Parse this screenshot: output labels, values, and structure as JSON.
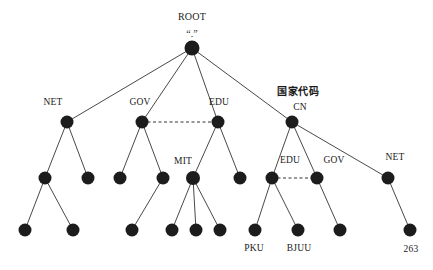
{
  "diagram": {
    "type": "tree",
    "background": "#ffffff",
    "node_color": "#1c1c1c",
    "edge_color": "#333333",
    "nodes": [
      {
        "id": "root",
        "label": "ROOT",
        "sublabel": "“.”",
        "x": 192,
        "y": 48,
        "r": 7.5
      },
      {
        "id": "net",
        "label": "NET",
        "x": 67,
        "y": 122,
        "r": 6.5
      },
      {
        "id": "gov",
        "label": "GOV",
        "x": 142,
        "y": 122,
        "r": 6.5
      },
      {
        "id": "edu",
        "label": "EDU",
        "x": 218,
        "y": 122,
        "r": 6.5
      },
      {
        "id": "cn",
        "label": "CN",
        "toplabel": "国家代码",
        "x": 292,
        "y": 122,
        "r": 6.5
      },
      {
        "id": "net-a",
        "label": "",
        "x": 45,
        "y": 178,
        "r": 6.5
      },
      {
        "id": "net-b",
        "label": "",
        "x": 88,
        "y": 178,
        "r": 6.5
      },
      {
        "id": "gov-a",
        "label": "",
        "x": 120,
        "y": 178,
        "r": 6.5
      },
      {
        "id": "gov-b",
        "label": "",
        "x": 163,
        "y": 178,
        "r": 6.5
      },
      {
        "id": "mit",
        "label": "MIT",
        "x": 193,
        "y": 178,
        "r": 7.0
      },
      {
        "id": "edu-b",
        "label": "",
        "x": 240,
        "y": 178,
        "r": 6.5
      },
      {
        "id": "cn-edu",
        "label": "EDU",
        "x": 272,
        "y": 178,
        "r": 6.5
      },
      {
        "id": "cn-gov",
        "label": "GOV",
        "x": 317,
        "y": 178,
        "r": 6.5
      },
      {
        "id": "cn-net",
        "label": "NET",
        "x": 388,
        "y": 178,
        "r": 6.5
      },
      {
        "id": "leaf-1",
        "label": "",
        "x": 25,
        "y": 230,
        "r": 6.5
      },
      {
        "id": "leaf-2",
        "label": "",
        "x": 73,
        "y": 230,
        "r": 6.5
      },
      {
        "id": "leaf-3",
        "label": "",
        "x": 132,
        "y": 230,
        "r": 6.5
      },
      {
        "id": "leaf-4",
        "label": "",
        "x": 172,
        "y": 230,
        "r": 6.5
      },
      {
        "id": "leaf-5",
        "label": "",
        "x": 196,
        "y": 230,
        "r": 6.5
      },
      {
        "id": "leaf-6",
        "label": "",
        "x": 220,
        "y": 230,
        "r": 6.5
      },
      {
        "id": "pku",
        "label": "PKU",
        "x": 255,
        "y": 230,
        "r": 6.5
      },
      {
        "id": "bjuu",
        "label": "BJUU",
        "x": 298,
        "y": 230,
        "r": 6.5
      },
      {
        "id": "leaf-9",
        "label": "",
        "x": 340,
        "y": 230,
        "r": 6.5
      },
      {
        "id": "n263",
        "label": "263",
        "x": 410,
        "y": 230,
        "r": 6.5
      }
    ],
    "edges": [
      {
        "from": "root",
        "to": "net"
      },
      {
        "from": "root",
        "to": "gov"
      },
      {
        "from": "root",
        "to": "edu"
      },
      {
        "from": "root",
        "to": "cn"
      },
      {
        "from": "net",
        "to": "net-a"
      },
      {
        "from": "net",
        "to": "net-b"
      },
      {
        "from": "gov",
        "to": "gov-a"
      },
      {
        "from": "gov",
        "to": "gov-b"
      },
      {
        "from": "edu",
        "to": "mit"
      },
      {
        "from": "edu",
        "to": "edu-b"
      },
      {
        "from": "cn",
        "to": "cn-edu"
      },
      {
        "from": "cn",
        "to": "cn-gov"
      },
      {
        "from": "cn",
        "to": "cn-net"
      },
      {
        "from": "net-a",
        "to": "leaf-1"
      },
      {
        "from": "net-a",
        "to": "leaf-2"
      },
      {
        "from": "gov-b",
        "to": "leaf-3"
      },
      {
        "from": "mit",
        "to": "leaf-4"
      },
      {
        "from": "mit",
        "to": "leaf-5"
      },
      {
        "from": "mit",
        "to": "leaf-6"
      },
      {
        "from": "cn-edu",
        "to": "pku"
      },
      {
        "from": "cn-edu",
        "to": "bjuu"
      },
      {
        "from": "cn-gov",
        "to": "leaf-9"
      },
      {
        "from": "cn-net",
        "to": "n263"
      }
    ],
    "dashed_links": [
      {
        "from": "gov",
        "to": "edu"
      },
      {
        "from": "cn-edu",
        "to": "cn-gov"
      }
    ],
    "labels": [
      {
        "id": "lbl-root",
        "text": "ROOT",
        "x": 192,
        "y": 17,
        "kind": "root"
      },
      {
        "id": "lbl-rootdot",
        "text": "“.”",
        "x": 192,
        "y": 34,
        "kind": "dot"
      },
      {
        "id": "lbl-net",
        "text": "NET",
        "x": 53,
        "y": 103,
        "kind": "plain"
      },
      {
        "id": "lbl-gov",
        "text": "GOV",
        "x": 140,
        "y": 103,
        "kind": "plain"
      },
      {
        "id": "lbl-edu",
        "text": "EDU",
        "x": 219,
        "y": 103,
        "kind": "plain"
      },
      {
        "id": "lbl-cjk",
        "text": "国家代码",
        "x": 298,
        "y": 92,
        "kind": "cjk"
      },
      {
        "id": "lbl-cn",
        "text": "CN",
        "x": 300,
        "y": 108,
        "kind": "plain"
      },
      {
        "id": "lbl-mit",
        "text": "MIT",
        "x": 183,
        "y": 162,
        "kind": "plain"
      },
      {
        "id": "lbl-cnedu",
        "text": "EDU",
        "x": 290,
        "y": 161,
        "kind": "plain"
      },
      {
        "id": "lbl-cngov",
        "text": "GOV",
        "x": 334,
        "y": 161,
        "kind": "plain"
      },
      {
        "id": "lbl-cnnet",
        "text": "NET",
        "x": 395,
        "y": 158,
        "kind": "plain"
      },
      {
        "id": "lbl-pku",
        "text": "PKU",
        "x": 254,
        "y": 249,
        "kind": "plain"
      },
      {
        "id": "lbl-bjuu",
        "text": "BJUU",
        "x": 299,
        "y": 249,
        "kind": "plain"
      },
      {
        "id": "lbl-263",
        "text": "263",
        "x": 411,
        "y": 250,
        "kind": "plain"
      }
    ]
  }
}
